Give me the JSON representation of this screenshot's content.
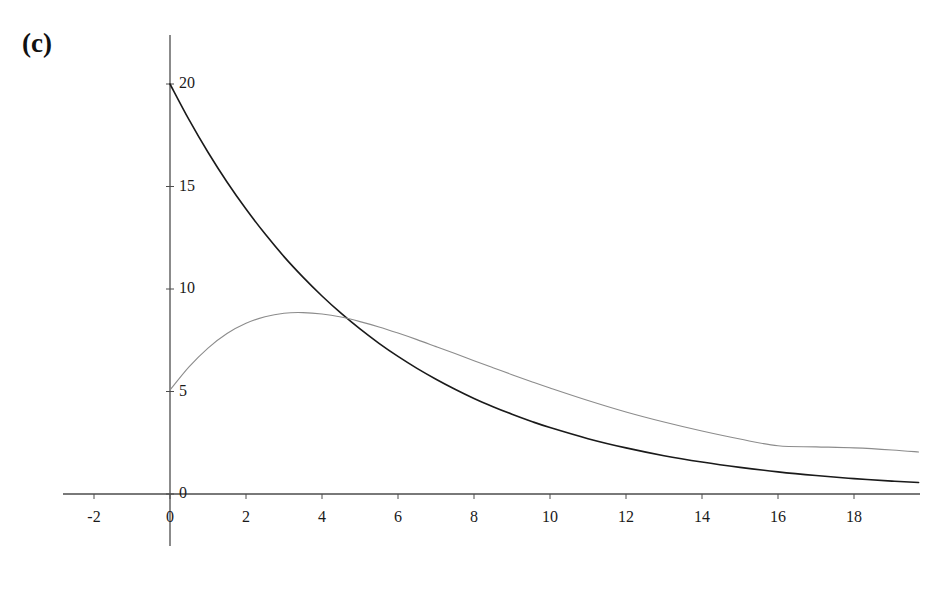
{
  "figure": {
    "panel_label": "(c)",
    "background_color": "#ffffff"
  },
  "chart_data": {
    "type": "line",
    "title": "",
    "xlabel": "",
    "ylabel": "",
    "xlim": [
      -3.2,
      20.6
    ],
    "ylim": [
      -2.5,
      22.4
    ],
    "xticks": [
      -2,
      0,
      2,
      4,
      6,
      8,
      10,
      12,
      14,
      16,
      18
    ],
    "xtick_labels": [
      "-2",
      "0",
      "2",
      "4",
      "6",
      "8",
      "10",
      "12",
      "14",
      "16",
      "18"
    ],
    "yticks": [
      0,
      5,
      10,
      15,
      20
    ],
    "ytick_labels": [
      "0",
      "5",
      "10",
      "15",
      "20"
    ],
    "grid": false,
    "legend": null,
    "axes_style": "cross-spines-at-origin",
    "axis_color": "#4d4d4d",
    "series": [
      {
        "name": "decaying-curve",
        "color": "#1a1a1a",
        "line_width": 1.6,
        "x": [
          0,
          0.5,
          1,
          1.5,
          2,
          2.5,
          3,
          3.5,
          4,
          4.5,
          5,
          5.5,
          6,
          6.5,
          7,
          7.5,
          8,
          8.5,
          9,
          9.5,
          10,
          11,
          12,
          13,
          14,
          15,
          16,
          17,
          18,
          19,
          19.7
        ],
        "values": [
          20.0,
          18.26,
          16.67,
          15.22,
          13.9,
          12.69,
          11.58,
          10.58,
          9.66,
          8.82,
          8.05,
          7.35,
          6.71,
          6.13,
          5.6,
          5.11,
          4.66,
          4.26,
          3.89,
          3.55,
          3.24,
          2.7,
          2.25,
          1.87,
          1.56,
          1.3,
          1.08,
          0.9,
          0.75,
          0.63,
          0.56
        ]
      },
      {
        "name": "rise-and-decay-curve",
        "color": "#8c8c8c",
        "line_width": 1.1,
        "x": [
          0,
          0.5,
          1,
          1.5,
          2,
          2.5,
          3,
          3.5,
          4,
          4.5,
          5,
          5.5,
          6,
          6.5,
          7,
          7.5,
          8,
          8.5,
          9,
          9.5,
          10,
          11,
          12,
          13,
          14,
          15,
          16,
          17,
          18,
          19,
          19.7
        ],
        "values": [
          5.07,
          6.2,
          7.12,
          7.83,
          8.33,
          8.65,
          8.82,
          8.85,
          8.78,
          8.63,
          8.41,
          8.15,
          7.85,
          7.53,
          7.19,
          6.85,
          6.5,
          6.16,
          5.82,
          5.49,
          5.17,
          4.56,
          4.0,
          3.51,
          3.07,
          2.68,
          2.35,
          2.3,
          2.25,
          2.15,
          2.05
        ]
      }
    ],
    "annotations": [
      {
        "label": "(c)",
        "kind": "panel-label"
      }
    ],
    "intersection_point": {
      "x": 3.5,
      "y": 8.83
    }
  }
}
